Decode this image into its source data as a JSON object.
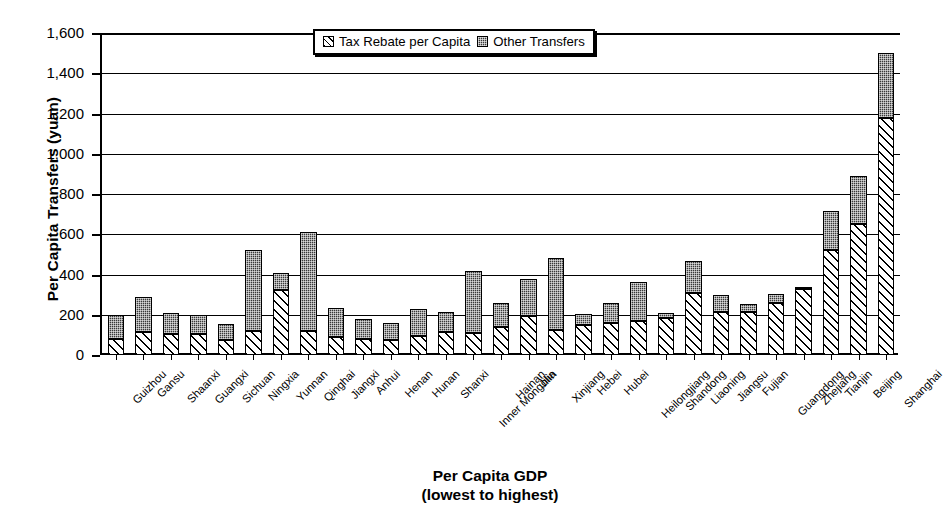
{
  "chart_data": {
    "type": "bar",
    "subtype": "stacked-bar",
    "title": "",
    "xlabel": "Per Capita GDP",
    "xlabel_line2": "(lowest to highest)",
    "ylabel": "Per Capita Transfers (yuan)",
    "ylim": [
      0,
      1600
    ],
    "yticks": [
      0,
      200,
      400,
      600,
      800,
      1000,
      1200,
      1400,
      1600
    ],
    "ytick_labels": [
      "0",
      "200",
      "400",
      "600",
      "800",
      "1,000",
      "1,200",
      "1,400",
      "1,600"
    ],
    "grid": "horizontal",
    "legend_position": "top-center",
    "categories": [
      "Guizhou",
      "Gansu",
      "Shaanxi",
      "Guangxi",
      "Sichuan",
      "Ningxia",
      "Yunnan",
      "Qinghai",
      "Jiangxi",
      "Anhui",
      "Henan",
      "Hunan",
      "Shanxi",
      "Inner Mongolia",
      "Hainan",
      "Jilin",
      "Xinjiang",
      "Hebei",
      "Hubei",
      "Heilongjiang",
      "Shandong",
      "Liaoning",
      "Jiangsu",
      "Fujian",
      "Guangdong",
      "Zhejiang",
      "Tianjin",
      "Beijing",
      "Shanghai"
    ],
    "series": [
      {
        "name": "Tax Rebate per Capita",
        "pattern": "diagonal-hatch",
        "color": "#ffffff",
        "values": [
          80,
          115,
          105,
          105,
          75,
          120,
          325,
          120,
          90,
          80,
          75,
          95,
          115,
          110,
          140,
          195,
          125,
          150,
          160,
          170,
          185,
          310,
          215,
          215,
          260,
          330,
          520,
          650,
          1180
        ]
      },
      {
        "name": "Other Transfers",
        "pattern": "dark-checker",
        "color": "#3a3a3a",
        "values": [
          118,
          175,
          105,
          93,
          78,
          400,
          85,
          490,
          145,
          98,
          85,
          135,
          100,
          310,
          120,
          185,
          355,
          55,
          100,
          195,
          25,
          155,
          85,
          40,
          45,
          10,
          195,
          240,
          320
        ]
      }
    ],
    "totals": [
      198,
      290,
      210,
      198,
      153,
      520,
      410,
      610,
      235,
      178,
      160,
      230,
      215,
      420,
      260,
      380,
      480,
      205,
      260,
      365,
      210,
      465,
      300,
      255,
      305,
      340,
      715,
      890,
      1500
    ]
  },
  "legend": {
    "items": [
      {
        "label": "Tax Rebate per Capita",
        "swatch": "hatch-swatch-icon"
      },
      {
        "label": "Other Transfers",
        "swatch": "checker-swatch-icon"
      }
    ]
  }
}
